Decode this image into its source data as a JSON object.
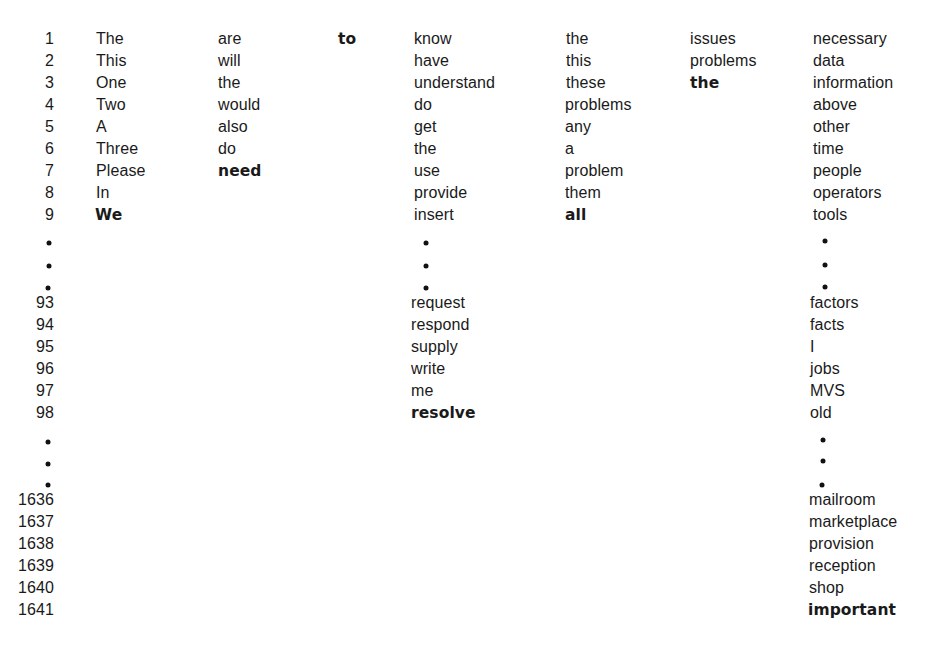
{
  "figure": {
    "row_indices": {
      "block1": [
        "1",
        "2",
        "3",
        "4",
        "5",
        "6",
        "7",
        "8",
        "9"
      ],
      "block2": [
        "93",
        "94",
        "95",
        "96",
        "97",
        "98"
      ],
      "block3": [
        "1636",
        "1637",
        "1638",
        "1639",
        "1640",
        "1641"
      ]
    },
    "columns": [
      {
        "id": "col1",
        "block1": [
          "The",
          "This",
          "One",
          "Two",
          "A",
          "Three",
          "Please",
          "In",
          "We"
        ],
        "bold_index": 8
      },
      {
        "id": "col2",
        "block1": [
          "are",
          "will",
          "the",
          "would",
          "also",
          "do",
          "need"
        ],
        "bold_index": 6
      },
      {
        "id": "col3",
        "block1": [
          "to"
        ],
        "bold_index": 0
      },
      {
        "id": "col4",
        "block1": [
          "know",
          "have",
          "understand",
          "do",
          "get",
          "the",
          "use",
          "provide",
          "insert"
        ],
        "block2": [
          "request",
          "respond",
          "supply",
          "write",
          "me",
          "resolve"
        ],
        "bold_block2_index": 5
      },
      {
        "id": "col5",
        "block1": [
          "the",
          "this",
          "these",
          "problems",
          "any",
          "a",
          "problem",
          "them",
          "all"
        ],
        "bold_index": 8
      },
      {
        "id": "col6",
        "block1": [
          "issues",
          "problems",
          "the"
        ],
        "bold_index": 2
      },
      {
        "id": "col7",
        "block1": [
          "necessary",
          "data",
          "information",
          "above",
          "other",
          "time",
          "people",
          "operators",
          "tools"
        ],
        "block2": [
          "factors",
          "facts",
          "I",
          "jobs",
          "MVS",
          "old"
        ],
        "block3": [
          "mailroom",
          "marketplace",
          "provision",
          "reception",
          "shop",
          "important"
        ],
        "bold_block3_index": 5
      }
    ],
    "ellipsis_symbol": "•"
  }
}
